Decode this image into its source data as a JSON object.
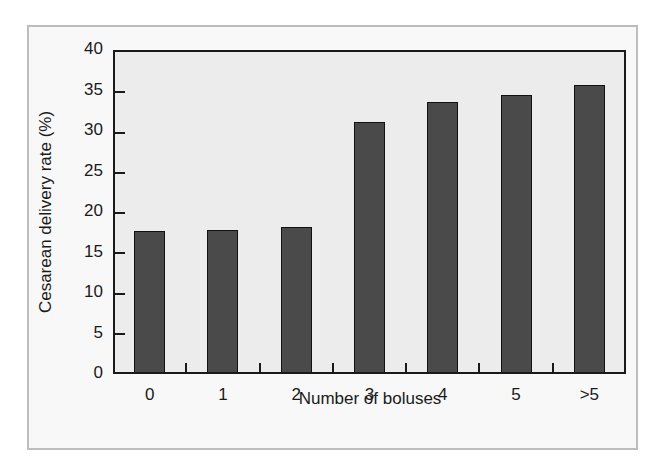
{
  "chart_data": {
    "type": "bar",
    "title": "",
    "xlabel": "Number of boluses",
    "ylabel": "Cesarean delivery rate (%)",
    "categories": [
      "0",
      "1",
      "2",
      "3",
      "4",
      "5",
      ">5"
    ],
    "values": [
      17.5,
      17.7,
      18.0,
      31.0,
      33.6,
      34.4,
      35.6
    ],
    "ylim": [
      0,
      40
    ],
    "yticks": [
      0,
      5,
      10,
      15,
      20,
      25,
      30,
      35,
      40
    ],
    "grid": false,
    "legend": null,
    "colors": {
      "bar": "#4a4a4a",
      "plot_bg": "#ececec",
      "frame_bg": "#f8f8f8",
      "frame_border": "#bdbdbd"
    }
  },
  "axes": {
    "y_title": "Cesarean delivery rate (%)",
    "x_title": "Number of boluses",
    "y_tick_labels": [
      "0",
      "5",
      "10",
      "15",
      "20",
      "25",
      "30",
      "35",
      "40"
    ],
    "x_tick_labels": [
      "0",
      "1",
      "2",
      "3",
      "4",
      "5",
      ">5"
    ]
  }
}
